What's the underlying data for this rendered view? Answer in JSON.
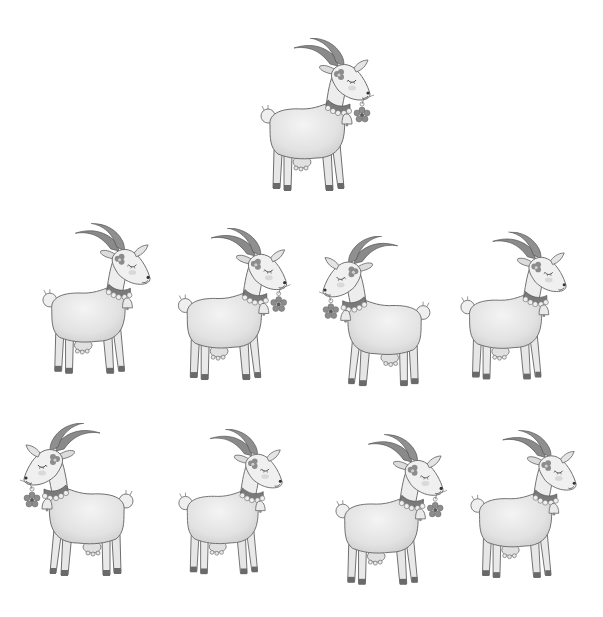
{
  "scene": {
    "description": "Grayscale illustration of nine cartoon goats with bells and collars",
    "background": "#ffffff",
    "colors": {
      "body": "#ececec",
      "body_shade": "#d6d6d6",
      "outline": "#6e6e6e",
      "horn": "#8a8a8a",
      "collar": "#7a7a7a",
      "bell": "#e8e8e8",
      "hoof": "#6a6a6a",
      "flower": "#8c8c8c"
    }
  },
  "goats": [
    {
      "id": "reference",
      "row": 0,
      "x": 258,
      "y": 38,
      "w": 116,
      "h": 158,
      "facing": "right",
      "flower_in_mouth": true
    },
    {
      "id": "r1-1",
      "row": 1,
      "x": 40,
      "y": 222,
      "w": 114,
      "h": 158,
      "facing": "right",
      "flower_in_mouth": false
    },
    {
      "id": "r1-2",
      "row": 1,
      "x": 175,
      "y": 228,
      "w": 116,
      "h": 157,
      "facing": "right",
      "flower_in_mouth": true
    },
    {
      "id": "r1-3",
      "row": 1,
      "x": 318,
      "y": 236,
      "w": 116,
      "h": 155,
      "facing": "left",
      "flower_in_mouth": true
    },
    {
      "id": "r1-4",
      "row": 1,
      "x": 458,
      "y": 230,
      "w": 112,
      "h": 156,
      "facing": "right",
      "flower_in_mouth": false
    },
    {
      "id": "r2-1",
      "row": 2,
      "x": 20,
      "y": 423,
      "w": 116,
      "h": 158,
      "facing": "left",
      "flower_in_mouth": true
    },
    {
      "id": "r2-2",
      "row": 2,
      "x": 176,
      "y": 425,
      "w": 110,
      "h": 158,
      "facing": "right",
      "flower_in_mouth": false
    },
    {
      "id": "r2-3",
      "row": 2,
      "x": 333,
      "y": 433,
      "w": 114,
      "h": 158,
      "facing": "right",
      "flower_in_mouth": true
    },
    {
      "id": "r2-4",
      "row": 2,
      "x": 468,
      "y": 428,
      "w": 112,
      "h": 157,
      "facing": "right",
      "flower_in_mouth": false
    }
  ]
}
